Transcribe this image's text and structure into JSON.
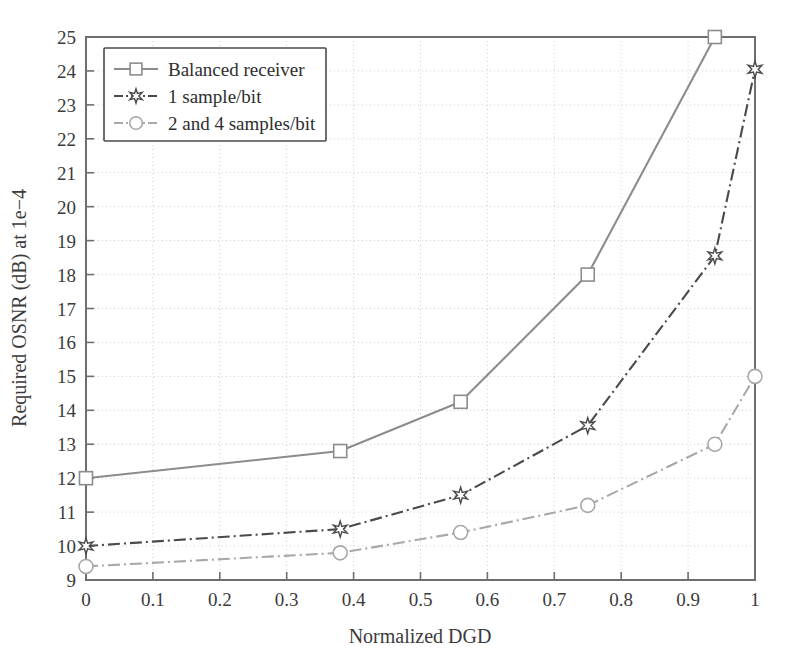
{
  "chart_data": {
    "type": "line",
    "title": "",
    "xlabel": "Normalized DGD",
    "ylabel": "Required OSNR (dB) at 1e−4",
    "xlim": [
      0,
      1
    ],
    "ylim": [
      9,
      25
    ],
    "xticks": [
      0,
      0.1,
      0.2,
      0.3,
      0.4,
      0.5,
      0.6,
      0.7,
      0.8,
      0.9,
      1
    ],
    "xticklabels": [
      "0",
      "0.1",
      "0.2",
      "0.3",
      "0.4",
      "0.5",
      "0.6",
      "0.7",
      "0.8",
      "0.9",
      "1"
    ],
    "yticks": [
      9,
      10,
      11,
      12,
      13,
      14,
      15,
      16,
      17,
      18,
      19,
      20,
      21,
      22,
      23,
      24,
      25
    ],
    "yticklabels": [
      "9",
      "10",
      "11",
      "12",
      "13",
      "14",
      "15",
      "16",
      "17",
      "18",
      "19",
      "20",
      "21",
      "22",
      "23",
      "24",
      "25"
    ],
    "grid": true,
    "legend_position": "upper left",
    "series": [
      {
        "name": "Balanced receiver",
        "marker": "square",
        "linestyle": "solid",
        "color": "#8c8c8c",
        "x": [
          0,
          0.38,
          0.56,
          0.75,
          0.94
        ],
        "y": [
          12.0,
          12.8,
          14.25,
          18.0,
          25.0
        ]
      },
      {
        "name": "1 sample/bit",
        "marker": "star",
        "linestyle": "dashdot",
        "color": "#4a4a4a",
        "x": [
          0,
          0.38,
          0.56,
          0.75,
          0.94,
          1.0
        ],
        "y": [
          10.0,
          10.5,
          11.5,
          13.55,
          18.55,
          24.05
        ]
      },
      {
        "name": "2 and 4 samples/bit",
        "marker": "circle",
        "linestyle": "dashdot",
        "color": "#a8a8a8",
        "x": [
          0,
          0.38,
          0.56,
          0.75,
          0.94,
          1.0
        ],
        "y": [
          9.4,
          9.8,
          10.4,
          11.2,
          13.0,
          15.0
        ]
      }
    ]
  },
  "legend": {
    "entries": [
      "Balanced receiver",
      "1 sample/bit",
      "2 and 4 samples/bit"
    ]
  }
}
